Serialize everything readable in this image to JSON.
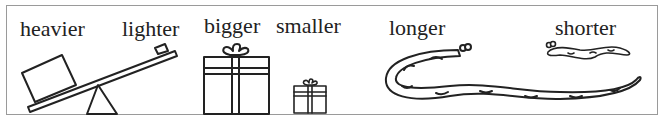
{
  "pairs": [
    {
      "left": "heavier",
      "right": "lighter"
    },
    {
      "left": "bigger",
      "right": "smaller"
    },
    {
      "left": "longer",
      "right": "shorter"
    }
  ],
  "colors": {
    "ink": "#222222",
    "border": "#9a9a9a",
    "background": "#ffffff"
  }
}
